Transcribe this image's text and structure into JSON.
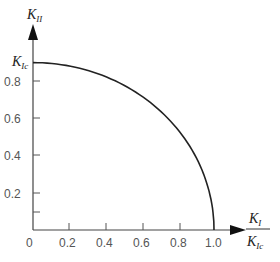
{
  "chart_data": {
    "type": "line",
    "title": "",
    "xlabel": "K_I / K_Ic",
    "ylabel": "K_II",
    "y_intercept_label": "K_Ic",
    "xlim": [
      0,
      1.0
    ],
    "ylim": [
      0,
      0.9
    ],
    "x_ticks": [
      "0",
      "0.2",
      "0.4",
      "0.6",
      "0.8",
      "1.0"
    ],
    "y_ticks": [
      "0.2",
      "0.4",
      "0.6",
      "0.8"
    ],
    "y_minor_tick_unlabeled": 0.1,
    "grid": false,
    "legend": null,
    "series": [
      {
        "name": "fracture envelope",
        "x": [
          0.0,
          0.1,
          0.2,
          0.3,
          0.4,
          0.5,
          0.6,
          0.7,
          0.8,
          0.9,
          0.95,
          1.0
        ],
        "y": [
          0.9,
          0.896,
          0.882,
          0.859,
          0.825,
          0.779,
          0.72,
          0.643,
          0.54,
          0.392,
          0.281,
          0.0
        ]
      }
    ]
  },
  "labels": {
    "y_axis_symbol": "K",
    "y_axis_sub": "II",
    "y_intercept_symbol": "K",
    "y_intercept_sub": "Ic",
    "x_num_symbol": "K",
    "x_num_sub": "I",
    "x_den_symbol": "K",
    "x_den_sub": "Ic",
    "x_tick_0": "0",
    "x_tick_1": "0.2",
    "x_tick_2": "0.4",
    "x_tick_3": "0.6",
    "x_tick_4": "0.8",
    "x_tick_5": "1.0",
    "y_tick_1": "0.2",
    "y_tick_2": "0.4",
    "y_tick_3": "0.6",
    "y_tick_4": "0.8"
  }
}
